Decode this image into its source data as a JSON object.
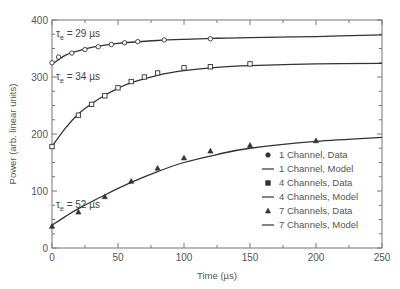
{
  "chart_data": {
    "type": "line",
    "title": "",
    "xlabel": "Time (µs)",
    "ylabel": "Power (arb. linear units)",
    "xlim": [
      0,
      250
    ],
    "ylim": [
      0,
      400
    ],
    "xticks": [
      0,
      50,
      100,
      150,
      200,
      250
    ],
    "yticks": [
      0,
      100,
      200,
      300,
      400
    ],
    "grid": false,
    "legend_position": "lower right",
    "series": [
      {
        "name": "1 Channel, Data",
        "kind": "scatter",
        "marker": "circle",
        "x": [
          0,
          5,
          15,
          25,
          35,
          45,
          55,
          65,
          85,
          120
        ],
        "y": [
          325,
          335,
          342,
          348,
          353,
          357,
          360,
          362,
          365,
          367
        ]
      },
      {
        "name": "1 Channel, Model",
        "kind": "line",
        "tau_us": 29,
        "x": [
          0,
          10,
          20,
          30,
          40,
          50,
          60,
          80,
          100,
          125,
          150,
          200,
          250
        ],
        "y": [
          322,
          338,
          346,
          352,
          356,
          359,
          361,
          364,
          366,
          368,
          369,
          371,
          374
        ]
      },
      {
        "name": "4 Channels, Data",
        "kind": "scatter",
        "marker": "square",
        "x": [
          0,
          20,
          30,
          40,
          50,
          60,
          70,
          80,
          100,
          120,
          150
        ],
        "y": [
          178,
          233,
          252,
          267,
          281,
          292,
          300,
          307,
          316,
          318,
          323
        ]
      },
      {
        "name": "4 Channels, Model",
        "kind": "line",
        "tau_us": 34,
        "x": [
          0,
          10,
          20,
          30,
          40,
          50,
          60,
          80,
          100,
          125,
          150,
          200,
          250
        ],
        "y": [
          178,
          210,
          235,
          253,
          268,
          280,
          290,
          303,
          311,
          317,
          320,
          323,
          324
        ]
      },
      {
        "name": "7 Channels, Data",
        "kind": "scatter",
        "marker": "triangle",
        "x": [
          0,
          20,
          40,
          60,
          80,
          100,
          120,
          150,
          200
        ],
        "y": [
          38,
          63,
          90,
          117,
          140,
          158,
          170,
          180,
          188
        ]
      },
      {
        "name": "7 Channels, Model",
        "kind": "line",
        "tau_us": 52,
        "x": [
          0,
          10,
          20,
          40,
          60,
          80,
          100,
          125,
          150,
          200,
          250
        ],
        "y": [
          40,
          55,
          69,
          93,
          115,
          134,
          150,
          164,
          175,
          187,
          194
        ]
      }
    ],
    "annotations": [
      {
        "text_tau": "τ",
        "text_sub": "e",
        "text_rest": " = 29 µs",
        "x": 2,
        "y": 375
      },
      {
        "text_tau": "τ",
        "text_sub": "e",
        "text_rest": " = 34 µs",
        "x": 2,
        "y": 290
      },
      {
        "text_tau": "τ",
        "text_sub": "e",
        "text_rest": " = 52 µs",
        "x": 2,
        "y": 112
      }
    ]
  },
  "legend": [
    {
      "label": "1 Channel, Data",
      "symbol": "circle"
    },
    {
      "label": "1 Channel, Model",
      "symbol": "line"
    },
    {
      "label": "4 Channels, Data",
      "symbol": "square"
    },
    {
      "label": "4 Channels, Model",
      "symbol": "line"
    },
    {
      "label": "7 Channels, Data",
      "symbol": "triangle"
    },
    {
      "label": "7 Channels, Model",
      "symbol": "line"
    }
  ],
  "colors": {
    "line": "#333333",
    "axis": "#777777",
    "text": "#555555"
  }
}
